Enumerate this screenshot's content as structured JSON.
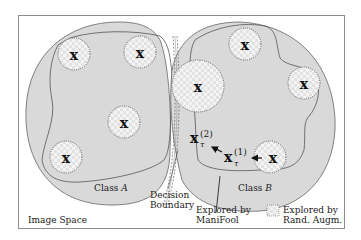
{
  "diagram": {
    "frame_label": "Image Space",
    "class_a": {
      "label_prefix": "Class ",
      "label_var": "A"
    },
    "class_b": {
      "label_prefix": "Class ",
      "label_var": "B"
    },
    "decision_boundary": {
      "line1": "Decision",
      "line2": "Boundary"
    },
    "manifool": {
      "line1": "Explored by",
      "line2": "ManiFool"
    },
    "legend": {
      "line1": "Explored by",
      "line2": "Rand. Augm."
    },
    "sample_mark": "x",
    "xt2": {
      "base": "x",
      "sub": "τ",
      "sup": "(2)"
    },
    "xt1": {
      "base": "x",
      "sub": "τ",
      "sup": "(1)"
    },
    "colors": {
      "region_fill": "#d9d9d9",
      "frame_stroke": "#8c8c8c",
      "outline": "#555555",
      "checker_light": "#f4f4f4",
      "checker_dark": "#e4e4e4"
    }
  }
}
